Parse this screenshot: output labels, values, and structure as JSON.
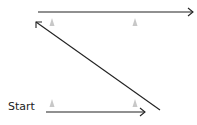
{
  "diagram": {
    "start_label": "Start",
    "colors": {
      "line": "#222222",
      "cone": "#bdbdbd"
    },
    "paths": [
      {
        "name": "bottom-run",
        "from": [
          46,
          112
        ],
        "to": [
          145,
          112
        ],
        "arrow": "end"
      },
      {
        "name": "diagonal-return",
        "from": [
          160,
          110
        ],
        "to": [
          35,
          21
        ],
        "arrow": "end"
      },
      {
        "name": "top-run",
        "from": [
          38,
          12
        ],
        "to": [
          193,
          12
        ],
        "arrow": "end"
      }
    ],
    "cones": [
      [
        52,
        22
      ],
      [
        135,
        22
      ],
      [
        52,
        104
      ],
      [
        135,
        104
      ]
    ]
  }
}
